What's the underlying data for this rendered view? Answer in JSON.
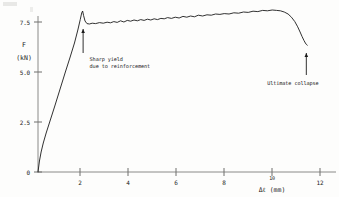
{
  "chart_data": {
    "type": "line",
    "title": "",
    "subtitle": "",
    "xlabel": "Δℓ (mm)",
    "ylabel_line1": "F",
    "ylabel_line2": "(kN)",
    "ylabel": "F (kN)",
    "xlim": [
      0,
      12.8
    ],
    "ylim": [
      0,
      8.6
    ],
    "xticks": [
      2,
      4,
      6,
      8,
      10,
      12
    ],
    "xtick_labels": [
      "2",
      "4",
      "6",
      "8",
      "10",
      "12"
    ],
    "yticks": [
      0,
      2.5,
      5.0,
      7.5
    ],
    "ytick_labels": [
      "0",
      "2.5",
      "5.0",
      "7.5"
    ],
    "grid": false,
    "legend": null,
    "series": [
      {
        "name": "load-displacement",
        "color": "#1a1a1a",
        "x": [
          0.0,
          0.06,
          0.13,
          0.22,
          0.34,
          0.5,
          0.7,
          0.92,
          1.14,
          1.34,
          1.52,
          1.66,
          1.76,
          1.82,
          1.86,
          1.9,
          1.96,
          2.04,
          2.14,
          2.26,
          2.4,
          2.56,
          2.72,
          2.88,
          3.02,
          3.16,
          3.3,
          3.44,
          3.58,
          3.72,
          3.86,
          4.0,
          4.14,
          4.28,
          4.42,
          4.56,
          4.7,
          4.84,
          4.98,
          5.12,
          5.26,
          5.4,
          5.56,
          5.72,
          5.88,
          6.04,
          6.2,
          6.36,
          6.52,
          6.68,
          6.86,
          7.04,
          7.22,
          7.4,
          7.58,
          7.76,
          7.96,
          8.16,
          8.36,
          8.56,
          8.76,
          8.96,
          9.16,
          9.36,
          9.56,
          9.76,
          9.94,
          10.1,
          10.26,
          10.42,
          10.56,
          10.7,
          10.82,
          10.92,
          11.0,
          11.08,
          11.14,
          11.18,
          11.22
        ],
        "y": [
          0.0,
          0.55,
          1.0,
          1.45,
          1.95,
          2.55,
          3.3,
          4.15,
          5.0,
          5.75,
          6.45,
          7.1,
          7.62,
          7.95,
          8.05,
          7.82,
          7.55,
          7.42,
          7.4,
          7.44,
          7.42,
          7.47,
          7.44,
          7.49,
          7.46,
          7.52,
          7.48,
          7.56,
          7.5,
          7.58,
          7.54,
          7.6,
          7.56,
          7.62,
          7.58,
          7.64,
          7.6,
          7.66,
          7.62,
          7.68,
          7.66,
          7.72,
          7.68,
          7.74,
          7.7,
          7.78,
          7.74,
          7.8,
          7.76,
          7.84,
          7.8,
          7.86,
          7.84,
          7.9,
          7.88,
          7.92,
          7.9,
          7.96,
          7.94,
          8.0,
          7.98,
          8.04,
          8.02,
          8.08,
          8.06,
          8.1,
          8.08,
          8.06,
          8.0,
          7.9,
          7.74,
          7.52,
          7.26,
          7.0,
          6.78,
          6.58,
          6.45,
          6.38,
          6.34
        ]
      }
    ],
    "annotations": [
      {
        "id": "sharp-yield",
        "text_lines": [
          "Sharp yield",
          "due to reinforcement"
        ],
        "text": "Sharp yield due to reinforcement",
        "arrow_tip_x": 1.88,
        "arrow_tip_y": 7.15,
        "arrow_tail_y": 5.95,
        "text_x": 2.15,
        "text_y": 5.55
      },
      {
        "id": "ultimate-collapse",
        "text_lines": [
          "Ultimate collapse"
        ],
        "text": "Ultimate collapse",
        "arrow_tip_x": 11.18,
        "arrow_tip_y": 5.95,
        "arrow_tail_y": 4.85,
        "text_x": 9.55,
        "text_y": 4.35
      }
    ]
  },
  "figure": {
    "background_color": "#fdfdfc",
    "line_color": "#1a1a1a",
    "axis_color": "#8a8a88"
  }
}
